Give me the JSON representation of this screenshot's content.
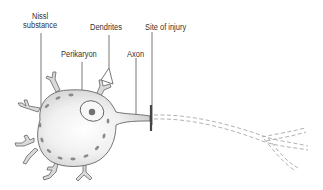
{
  "diagram": {
    "labels": {
      "nissl_line1": "Nissl",
      "nissl_line2": "substance",
      "dendrites": "Dendrites",
      "site_of_injury": "Site of injury",
      "perikaryon": "Perikaryon",
      "axon": "Axon"
    },
    "colors": {
      "cell_fill": "#d9d9d9",
      "cell_highlight": "#ffffff",
      "outline": "#666666",
      "nissl_granules": "#8a8a8a",
      "nucleolus": "#6e6e6e",
      "injury_bar": "#444444",
      "degenerating_axon": "#a8a8a8",
      "leader_lines": "#555555"
    }
  }
}
